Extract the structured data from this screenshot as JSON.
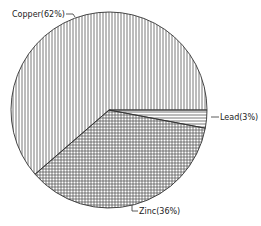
{
  "chart_data": {
    "type": "pie",
    "title": "",
    "categories": [
      "Copper",
      "Lead",
      "Zinc"
    ],
    "values": [
      62,
      3,
      36
    ],
    "labels": [
      "Copper(62%)",
      "Lead(3%)",
      "Zinc(36%)"
    ],
    "patterns": [
      "vertical-lines",
      "horizontal-lines",
      "crosshatch"
    ],
    "legend": "none (leader-line labels)",
    "colors": {
      "line": "#333333",
      "background": "#ffffff"
    }
  },
  "labels": {
    "copper": "Copper(62%)",
    "lead": "Lead(3%)",
    "zinc": "Zinc(36%)"
  }
}
